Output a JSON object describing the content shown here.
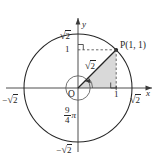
{
  "figure": {
    "type": "math-diagram",
    "colors": {
      "stroke": "#262626",
      "triangle_fill": "#d9d9d9",
      "dashed": "#595959",
      "background": "#ffffff"
    },
    "axes": {
      "x_axis_label": "x",
      "y_axis_label": "y",
      "origin_label": "O"
    },
    "labels": {
      "y_top": {
        "minus": "",
        "radical": "√",
        "radicand": "2"
      },
      "y_one": "1",
      "y_bottom": {
        "minus": "−",
        "radical": "√",
        "radicand": "2"
      },
      "x_left": {
        "minus": "−",
        "radical": "√",
        "radicand": "2"
      },
      "x_one": "1",
      "x_right": {
        "minus": "",
        "radical": "√",
        "radicand": "2"
      },
      "point": "P(1, 1)",
      "radius": {
        "radical": "√",
        "radicand": "2"
      },
      "angle": {
        "numerator": "9",
        "denominator": "4",
        "symbol": "π"
      }
    },
    "geometry": {
      "origin_px": {
        "x": 78,
        "y": 88
      },
      "circle_radius_px": 54,
      "unit_px": 38.2,
      "point_P_px": {
        "x": 116.2,
        "y": 49.8
      },
      "point_P_value": {
        "x": 1,
        "y": 1
      },
      "circle_radius_value": "√2",
      "angle_value_turns": 1.125,
      "angle_value_radians": "9π/4"
    }
  }
}
